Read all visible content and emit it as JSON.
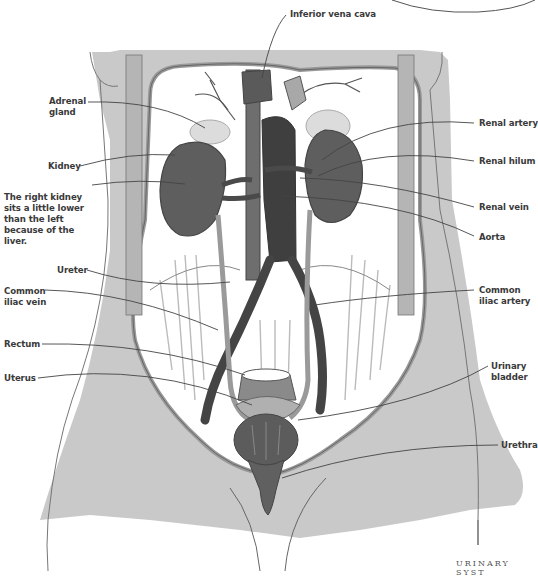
{
  "diagram": {
    "footer_text": "URINARY SYST",
    "colors": {
      "body_fill": "#c9c9c9",
      "organ_dark": "#5a5a5a",
      "vessel_dark": "#444444",
      "vessel_light": "#a8a8a8",
      "adrenal": "#d8d8d8",
      "outline": "#555555",
      "label_text": "#3a3a3a"
    },
    "labels": {
      "inferior_vena_cava": "Inferior vena cava",
      "adrenal_gland": "Adrenal gland",
      "kidney": "Kidney",
      "right_kidney_note": "The right kidney sits a little lower than the left because of the liver.",
      "ureter": "Ureter",
      "common_iliac_vein": "Common iliac vein",
      "rectum": "Rectum",
      "uterus": "Uterus",
      "renal_artery": "Renal artery",
      "renal_hilum": "Renal hilum",
      "renal_vein": "Renal vein",
      "aorta": "Aorta",
      "common_iliac_artery": "Common iliac artery",
      "urinary_bladder": "Urinary bladder",
      "urethra": "Urethra"
    }
  }
}
